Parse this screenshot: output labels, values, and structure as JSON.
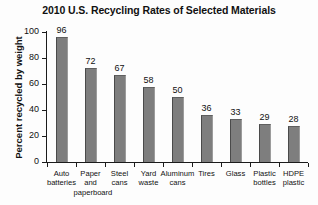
{
  "chart_data": {
    "type": "bar",
    "title": "2010 U.S. Recycling Rates of Selected Materials",
    "xlabel": "",
    "ylabel": "Percent recycled by weight",
    "ylim": [
      0,
      100
    ],
    "yticks": [
      0,
      20,
      40,
      60,
      80,
      100
    ],
    "grid": false,
    "legend": "none",
    "categories": [
      "Auto batteries",
      "Paper and paperboard",
      "Steel cans",
      "Yard waste",
      "Aluminum cans",
      "Tires",
      "Glass",
      "Plastic bottles",
      "HDPE plastic"
    ],
    "category_lines": [
      [
        "Auto",
        "batteries"
      ],
      [
        "Paper",
        "and",
        "paperboard"
      ],
      [
        "Steel",
        "cans"
      ],
      [
        "Yard",
        "waste"
      ],
      [
        "Aluminum",
        "cans"
      ],
      [
        "Tires"
      ],
      [
        "Glass"
      ],
      [
        "Plastic",
        "bottles"
      ],
      [
        "HDPE",
        "plastic"
      ]
    ],
    "values": [
      96,
      72,
      67,
      58,
      50,
      36,
      33,
      29,
      28
    ],
    "bar_color": "#7e7e7e"
  }
}
